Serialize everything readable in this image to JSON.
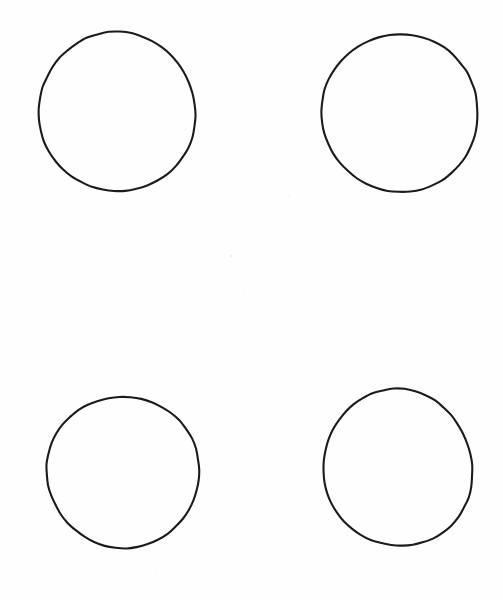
{
  "canvas": {
    "width": 503,
    "height": 599,
    "background_color": "#fefefe",
    "paper_tone": "#ffffff"
  },
  "drawing": {
    "medium": "hand-drawn ink on scanned paper",
    "stroke_color": "#1b1b1b",
    "stroke_width": 2.1,
    "fill": "none",
    "shape_count": 4,
    "layout": "2x2 grid",
    "shapes": [
      {
        "name": "circle-top-left",
        "row": 1,
        "column": 1,
        "center_x": 117,
        "center_y": 112,
        "radius_x": 79,
        "radius_y": 79,
        "bounds": {
          "left": 38,
          "top": 33,
          "right": 196,
          "bottom": 191
        },
        "wobble": 2.0,
        "rotation": -6
      },
      {
        "name": "circle-top-right",
        "row": 1,
        "column": 2,
        "center_x": 400,
        "center_y": 113,
        "radius_x": 79,
        "radius_y": 78,
        "bounds": {
          "left": 321,
          "top": 35,
          "right": 479,
          "bottom": 191
        },
        "wobble": 2.2,
        "rotation": 9
      },
      {
        "name": "circle-bottom-left",
        "row": 2,
        "column": 1,
        "center_x": 123,
        "center_y": 472,
        "radius_x": 77,
        "radius_y": 75,
        "bounds": {
          "left": 46,
          "top": 397,
          "right": 200,
          "bottom": 547
        },
        "wobble": 1.8,
        "rotation": 14
      },
      {
        "name": "circle-bottom-right",
        "row": 2,
        "column": 2,
        "center_x": 398,
        "center_y": 468,
        "radius_x": 75,
        "radius_y": 78,
        "bounds": {
          "left": 323,
          "top": 390,
          "right": 473,
          "bottom": 546
        },
        "wobble": 1.9,
        "rotation": -11
      }
    ]
  },
  "speckles": [
    {
      "x": 231,
      "y": 256,
      "r": 1.2,
      "o": 0.18
    },
    {
      "x": 246,
      "y": 263,
      "r": 0.8,
      "o": 0.12
    },
    {
      "x": 243,
      "y": 294,
      "r": 0.9,
      "o": 0.1
    },
    {
      "x": 62,
      "y": 112,
      "r": 0.8,
      "o": 0.1
    },
    {
      "x": 289,
      "y": 195,
      "r": 0.9,
      "o": 0.09
    },
    {
      "x": 430,
      "y": 300,
      "r": 0.8,
      "o": 0.08
    },
    {
      "x": 88,
      "y": 355,
      "r": 1.0,
      "o": 0.09
    },
    {
      "x": 155,
      "y": 570,
      "r": 0.9,
      "o": 0.1
    },
    {
      "x": 345,
      "y": 585,
      "r": 0.8,
      "o": 0.08
    },
    {
      "x": 468,
      "y": 455,
      "r": 0.7,
      "o": 0.08
    },
    {
      "x": 270,
      "y": 430,
      "r": 0.8,
      "o": 0.07
    },
    {
      "x": 200,
      "y": 320,
      "r": 0.7,
      "o": 0.07
    },
    {
      "x": 395,
      "y": 250,
      "r": 0.9,
      "o": 0.08
    },
    {
      "x": 110,
      "y": 250,
      "r": 0.7,
      "o": 0.07
    },
    {
      "x": 490,
      "y": 120,
      "r": 0.8,
      "o": 0.07
    },
    {
      "x": 20,
      "y": 480,
      "r": 0.8,
      "o": 0.07
    },
    {
      "x": 310,
      "y": 350,
      "r": 0.7,
      "o": 0.06
    },
    {
      "x": 175,
      "y": 480,
      "r": 0.7,
      "o": 0.06
    }
  ]
}
